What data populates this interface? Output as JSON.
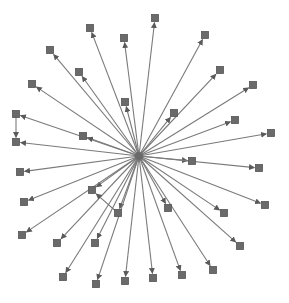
{
  "diagram": {
    "type": "directed-star-graph",
    "colors": {
      "background": "#ffffff",
      "edge": "#7a7a7a",
      "node": "#6a6a6a",
      "node_border": "#555555",
      "arrow": "#5a5a5a"
    },
    "hub": {
      "id": "hub",
      "x": 139,
      "y": 156
    },
    "node_size": 7,
    "nodes": [
      {
        "id": "n1",
        "x": 90,
        "y": 28
      },
      {
        "id": "n2",
        "x": 124,
        "y": 38
      },
      {
        "id": "n3",
        "x": 155,
        "y": 18
      },
      {
        "id": "n4",
        "x": 205,
        "y": 35
      },
      {
        "id": "n5",
        "x": 50,
        "y": 50
      },
      {
        "id": "n6",
        "x": 79,
        "y": 72
      },
      {
        "id": "n7",
        "x": 220,
        "y": 70
      },
      {
        "id": "n8",
        "x": 253,
        "y": 85
      },
      {
        "id": "n9",
        "x": 32,
        "y": 84
      },
      {
        "id": "n10",
        "x": 125,
        "y": 102
      },
      {
        "id": "n11",
        "x": 174,
        "y": 113
      },
      {
        "id": "n12",
        "x": 235,
        "y": 120
      },
      {
        "id": "n13",
        "x": 271,
        "y": 133
      },
      {
        "id": "n14",
        "x": 16,
        "y": 114
      },
      {
        "id": "n15",
        "x": 16,
        "y": 142
      },
      {
        "id": "n16",
        "x": 83,
        "y": 136
      },
      {
        "id": "n17",
        "x": 192,
        "y": 161
      },
      {
        "id": "n18",
        "x": 259,
        "y": 168
      },
      {
        "id": "n19",
        "x": 20,
        "y": 172
      },
      {
        "id": "n20",
        "x": 24,
        "y": 202
      },
      {
        "id": "n21",
        "x": 92,
        "y": 190
      },
      {
        "id": "n22",
        "x": 118,
        "y": 213
      },
      {
        "id": "n23",
        "x": 168,
        "y": 208
      },
      {
        "id": "n24",
        "x": 265,
        "y": 205
      },
      {
        "id": "n25",
        "x": 22,
        "y": 235
      },
      {
        "id": "n26",
        "x": 57,
        "y": 243
      },
      {
        "id": "n27",
        "x": 95,
        "y": 243
      },
      {
        "id": "n28",
        "x": 224,
        "y": 213
      },
      {
        "id": "n29",
        "x": 240,
        "y": 246
      },
      {
        "id": "n30",
        "x": 63,
        "y": 277
      },
      {
        "id": "n31",
        "x": 96,
        "y": 284
      },
      {
        "id": "n32",
        "x": 125,
        "y": 281
      },
      {
        "id": "n33",
        "x": 153,
        "y": 278
      },
      {
        "id": "n34",
        "x": 182,
        "y": 275
      },
      {
        "id": "n35",
        "x": 213,
        "y": 270
      }
    ],
    "edges": [
      {
        "from": "hub",
        "to": "n1"
      },
      {
        "from": "hub",
        "to": "n2"
      },
      {
        "from": "hub",
        "to": "n3"
      },
      {
        "from": "hub",
        "to": "n4"
      },
      {
        "from": "hub",
        "to": "n5"
      },
      {
        "from": "hub",
        "to": "n6"
      },
      {
        "from": "hub",
        "to": "n7"
      },
      {
        "from": "hub",
        "to": "n8"
      },
      {
        "from": "hub",
        "to": "n9"
      },
      {
        "from": "hub",
        "to": "n10"
      },
      {
        "from": "hub",
        "to": "n11"
      },
      {
        "from": "hub",
        "to": "n12"
      },
      {
        "from": "hub",
        "to": "n13"
      },
      {
        "from": "hub",
        "to": "n14"
      },
      {
        "from": "hub",
        "to": "n15"
      },
      {
        "from": "hub",
        "to": "n16"
      },
      {
        "from": "hub",
        "to": "n17"
      },
      {
        "from": "hub",
        "to": "n18"
      },
      {
        "from": "hub",
        "to": "n19"
      },
      {
        "from": "hub",
        "to": "n20"
      },
      {
        "from": "hub",
        "to": "n21"
      },
      {
        "from": "hub",
        "to": "n22"
      },
      {
        "from": "hub",
        "to": "n23"
      },
      {
        "from": "hub",
        "to": "n24"
      },
      {
        "from": "hub",
        "to": "n25"
      },
      {
        "from": "hub",
        "to": "n26"
      },
      {
        "from": "hub",
        "to": "n27"
      },
      {
        "from": "hub",
        "to": "n28"
      },
      {
        "from": "hub",
        "to": "n29"
      },
      {
        "from": "hub",
        "to": "n30"
      },
      {
        "from": "hub",
        "to": "n31"
      },
      {
        "from": "hub",
        "to": "n32"
      },
      {
        "from": "hub",
        "to": "n33"
      },
      {
        "from": "hub",
        "to": "n34"
      },
      {
        "from": "hub",
        "to": "n35"
      },
      {
        "from": "n14",
        "to": "n15"
      },
      {
        "from": "n22",
        "to": "n21"
      }
    ]
  }
}
